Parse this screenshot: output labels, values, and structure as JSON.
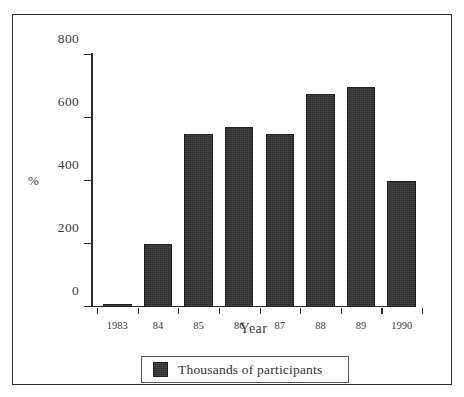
{
  "chart_data": {
    "type": "bar",
    "title": "",
    "subtitle": "",
    "xlabel": "Year",
    "ylabel": "%",
    "categories": [
      "1983",
      "84",
      "85",
      "86",
      "87",
      "88",
      "89",
      "1990"
    ],
    "values": [
      10,
      200,
      550,
      570,
      550,
      675,
      700,
      400
    ],
    "series": [
      {
        "name": "Thousands of participants",
        "values": [
          10,
          200,
          550,
          570,
          550,
          675,
          700,
          400
        ],
        "color": "#333333"
      }
    ],
    "ylim": [
      0,
      800
    ],
    "yticks": [
      0,
      200,
      400,
      600,
      800
    ],
    "ytick_labels": [
      "0",
      "200",
      "400",
      "600",
      "800"
    ],
    "grid": false,
    "legend_position": "bottom-center",
    "legend_entries": [
      "Thousands of participants"
    ],
    "annotations": []
  },
  "axes": {
    "y_title": "%",
    "x_title": "Year",
    "y_tick_labels": [
      "800",
      "600",
      "400",
      "200",
      "0"
    ],
    "x_tick_labels": [
      "1983",
      "84",
      "85",
      "86",
      "87",
      "88",
      "89",
      "1990"
    ]
  },
  "legend": {
    "label": "Thousands of participants",
    "swatch_color": "#333333"
  },
  "colors": {
    "bar": "#333333",
    "axis": "#2b2b2b",
    "text": "#3a3a3a",
    "frame": "#2b2b2b",
    "background": "#ffffff"
  }
}
